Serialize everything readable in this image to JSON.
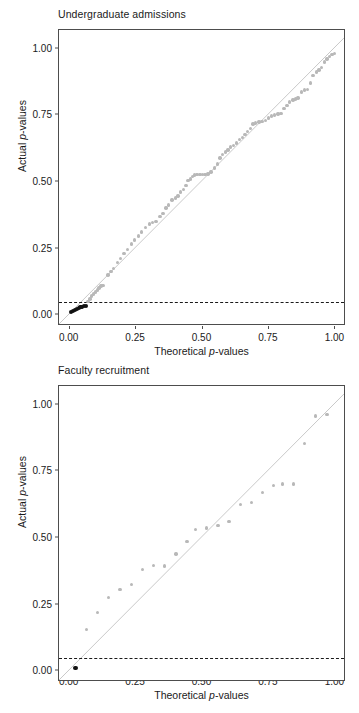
{
  "figure": {
    "width": 359,
    "height": 713,
    "background": "#ffffff"
  },
  "colors": {
    "significant_point": "#111111",
    "nonsignificant_point": "#b8b8b8",
    "reference_line": "#c9c9c9",
    "significance_line": "#1a1a1a",
    "axis": "#4d4d4d",
    "text": "#1a1a1a"
  },
  "common": {
    "xlabel": "Theoretical p-values",
    "ylabel": "Actual p-values",
    "xlabel_prefix": "Theoretical ",
    "xlabel_italic": "p",
    "xlabel_suffix": "-values",
    "ylabel_prefix": "Actual ",
    "ylabel_italic": "p",
    "ylabel_suffix": "-values",
    "xticks": [
      "0.00",
      "0.25",
      "0.50",
      "0.75",
      "1.00"
    ],
    "yticks": [
      "1.00",
      "0.75",
      "0.50",
      "0.25",
      "0.00"
    ],
    "xtick_values": [
      0.0,
      0.25,
      0.5,
      0.75,
      1.0
    ],
    "ytick_values": [
      1.0,
      0.75,
      0.5,
      0.25,
      0.0
    ],
    "significance_threshold": 0.05
  },
  "chart_data": [
    {
      "type": "scatter",
      "title": "Undergraduate admissions",
      "xlabel": "Theoretical p-values",
      "ylabel": "Actual p-values",
      "xlim": [
        -0.04,
        1.04
      ],
      "ylim": [
        -0.04,
        1.07
      ],
      "grid": false,
      "legend": "none",
      "annotations": [
        {
          "kind": "reference-line",
          "label": "identity line y = x",
          "from": [
            0,
            0
          ],
          "to": [
            1,
            1
          ]
        },
        {
          "kind": "threshold-line",
          "label": "p = 0.05",
          "y": 0.05,
          "style": "dashed"
        }
      ],
      "series": [
        {
          "name": "Significant (p < 0.05)",
          "color": "#111111",
          "points": [
            [
              0.006,
              0.011
            ],
            [
              0.013,
              0.016
            ],
            [
              0.02,
              0.021
            ],
            [
              0.027,
              0.025
            ],
            [
              0.034,
              0.028
            ],
            [
              0.041,
              0.03
            ],
            [
              0.048,
              0.031
            ],
            [
              0.055,
              0.034
            ],
            [
              0.062,
              0.035
            ]
          ]
        },
        {
          "name": "Not significant (p >= 0.05)",
          "color": "#b8b8b8",
          "points": [
            [
              0.069,
              0.052
            ],
            [
              0.076,
              0.062
            ],
            [
              0.083,
              0.072
            ],
            [
              0.09,
              0.08
            ],
            [
              0.097,
              0.088
            ],
            [
              0.104,
              0.095
            ],
            [
              0.111,
              0.103
            ],
            [
              0.118,
              0.11
            ],
            [
              0.125,
              0.112
            ],
            [
              0.145,
              0.152
            ],
            [
              0.155,
              0.165
            ],
            [
              0.165,
              0.175
            ],
            [
              0.18,
              0.198
            ],
            [
              0.192,
              0.213
            ],
            [
              0.205,
              0.232
            ],
            [
              0.218,
              0.247
            ],
            [
              0.232,
              0.268
            ],
            [
              0.245,
              0.283
            ],
            [
              0.258,
              0.297
            ],
            [
              0.27,
              0.312
            ],
            [
              0.285,
              0.33
            ],
            [
              0.3,
              0.343
            ],
            [
              0.312,
              0.348
            ],
            [
              0.325,
              0.352
            ],
            [
              0.34,
              0.37
            ],
            [
              0.352,
              0.383
            ],
            [
              0.362,
              0.403
            ],
            [
              0.372,
              0.414
            ],
            [
              0.385,
              0.432
            ],
            [
              0.398,
              0.44
            ],
            [
              0.408,
              0.448
            ],
            [
              0.418,
              0.463
            ],
            [
              0.428,
              0.472
            ],
            [
              0.438,
              0.488
            ],
            [
              0.446,
              0.505
            ],
            [
              0.455,
              0.512
            ],
            [
              0.462,
              0.52
            ],
            [
              0.47,
              0.527
            ],
            [
              0.48,
              0.528
            ],
            [
              0.49,
              0.528
            ],
            [
              0.5,
              0.528
            ],
            [
              0.51,
              0.529
            ],
            [
              0.52,
              0.53
            ],
            [
              0.532,
              0.538
            ],
            [
              0.545,
              0.552
            ],
            [
              0.556,
              0.568
            ],
            [
              0.566,
              0.59
            ],
            [
              0.576,
              0.603
            ],
            [
              0.586,
              0.613
            ],
            [
              0.596,
              0.62
            ],
            [
              0.606,
              0.632
            ],
            [
              0.616,
              0.638
            ],
            [
              0.628,
              0.647
            ],
            [
              0.64,
              0.66
            ],
            [
              0.65,
              0.668
            ],
            [
              0.66,
              0.678
            ],
            [
              0.67,
              0.69
            ],
            [
              0.68,
              0.7
            ],
            [
              0.69,
              0.718
            ],
            [
              0.7,
              0.722
            ],
            [
              0.712,
              0.725
            ],
            [
              0.724,
              0.727
            ],
            [
              0.736,
              0.73
            ],
            [
              0.748,
              0.74
            ],
            [
              0.76,
              0.748
            ],
            [
              0.772,
              0.752
            ],
            [
              0.784,
              0.755
            ],
            [
              0.796,
              0.757
            ],
            [
              0.806,
              0.775
            ],
            [
              0.818,
              0.787
            ],
            [
              0.828,
              0.8
            ],
            [
              0.84,
              0.808
            ],
            [
              0.85,
              0.812
            ],
            [
              0.86,
              0.815
            ],
            [
              0.872,
              0.838
            ],
            [
              0.884,
              0.845
            ],
            [
              0.896,
              0.848
            ],
            [
              0.906,
              0.872
            ],
            [
              0.916,
              0.9
            ],
            [
              0.928,
              0.912
            ],
            [
              0.938,
              0.92
            ],
            [
              0.948,
              0.93
            ],
            [
              0.958,
              0.95
            ],
            [
              0.968,
              0.962
            ],
            [
              0.978,
              0.97
            ],
            [
              0.988,
              0.978
            ],
            [
              0.996,
              0.982
            ]
          ]
        }
      ]
    },
    {
      "type": "scatter",
      "title": "Faculty recruitment",
      "xlabel": "Theoretical p-values",
      "ylabel": "Actual p-values",
      "xlim": [
        -0.04,
        1.04
      ],
      "ylim": [
        -0.04,
        1.07
      ],
      "grid": false,
      "legend": "none",
      "annotations": [
        {
          "kind": "reference-line",
          "label": "identity line y = x",
          "from": [
            0,
            0
          ],
          "to": [
            1,
            1
          ]
        },
        {
          "kind": "threshold-line",
          "label": "p = 0.05",
          "y": 0.05,
          "style": "dashed"
        }
      ],
      "series": [
        {
          "name": "Significant (p < 0.05)",
          "color": "#111111",
          "points": [
            [
              0.022,
              0.012
            ]
          ]
        },
        {
          "name": "Not significant (p >= 0.05)",
          "color": "#b8b8b8",
          "points": [
            [
              0.063,
              0.158
            ],
            [
              0.105,
              0.22
            ],
            [
              0.147,
              0.277
            ],
            [
              0.19,
              0.307
            ],
            [
              0.232,
              0.325
            ],
            [
              0.274,
              0.382
            ],
            [
              0.316,
              0.397
            ],
            [
              0.358,
              0.395
            ],
            [
              0.4,
              0.44
            ],
            [
              0.442,
              0.487
            ],
            [
              0.474,
              0.532
            ],
            [
              0.516,
              0.537
            ],
            [
              0.558,
              0.546
            ],
            [
              0.6,
              0.563
            ],
            [
              0.642,
              0.625
            ],
            [
              0.684,
              0.634
            ],
            [
              0.726,
              0.67
            ],
            [
              0.768,
              0.697
            ],
            [
              0.8,
              0.702
            ],
            [
              0.842,
              0.702
            ],
            [
              0.884,
              0.855
            ],
            [
              0.926,
              0.958
            ],
            [
              0.968,
              0.963
            ]
          ]
        }
      ]
    }
  ]
}
